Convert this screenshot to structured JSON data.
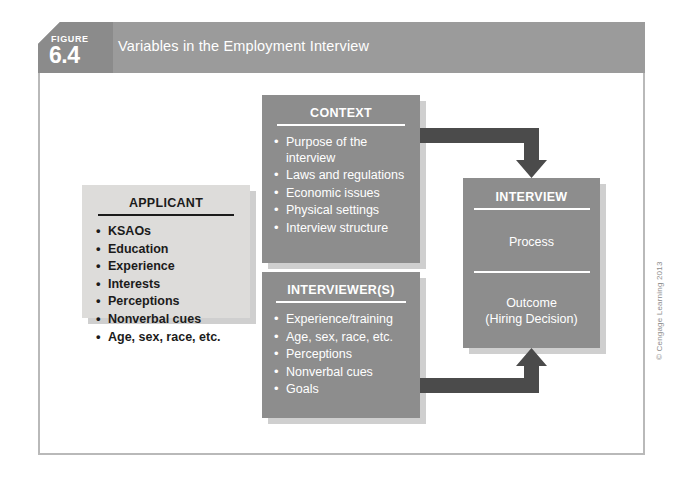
{
  "figure": {
    "badge_word": "FIGURE",
    "badge_number": "6.4",
    "title": "Variables in the Employment Interview"
  },
  "boxes": {
    "applicant": {
      "title": "APPLICANT",
      "items": [
        "KSAOs",
        "Education",
        "Experience",
        "Interests",
        "Perceptions",
        "Nonverbal cues",
        "Age, sex, race, etc."
      ]
    },
    "context": {
      "title": "CONTEXT",
      "items": [
        "Purpose of the interview",
        "Laws and regulations",
        "Economic issues",
        "Physical settings",
        "Interview structure"
      ]
    },
    "interviewers": {
      "title": "INTERVIEWER(S)",
      "items": [
        "Experience/training",
        "Age, sex, race, etc.",
        "Perceptions",
        "Nonverbal cues",
        "Goals"
      ]
    },
    "interview": {
      "title": "INTERVIEW",
      "process_label": "Process",
      "outcome_label_line1": "Outcome",
      "outcome_label_line2": "(Hiring Decision)"
    }
  },
  "arrows": [
    {
      "name": "context-to-interview",
      "from": "CONTEXT",
      "to": "INTERVIEW",
      "direction": "down"
    },
    {
      "name": "interviewers-to-interview",
      "from": "INTERVIEWER(S)",
      "to": "INTERVIEW",
      "direction": "up"
    }
  ],
  "credit": "© Cengage Learning 2013",
  "colors": {
    "header_bar": "#9b9b9b",
    "badge": "#8b8b8b",
    "dark_box": "#8d8d8d",
    "light_box": "#dddcda",
    "arrow": "#4b4b4b",
    "shadow": "#cfcfcf",
    "frame_border": "#b9b9b9",
    "page": "#ffffff"
  }
}
